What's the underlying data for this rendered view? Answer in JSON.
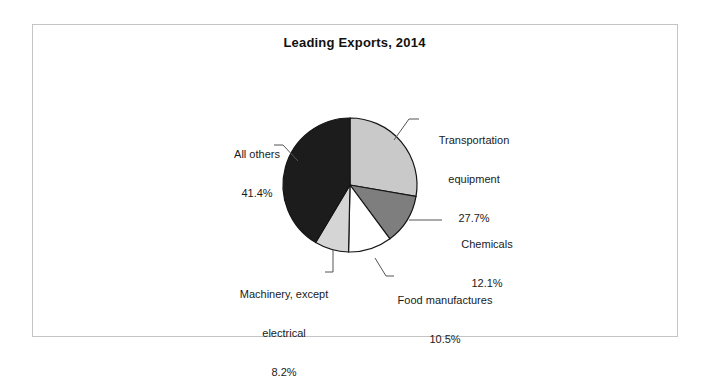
{
  "figure": {
    "title": "Leading Exports, 2014",
    "frame_color": "#c4c4c4",
    "background": "#ffffff"
  },
  "chart_data": {
    "type": "pie",
    "title": "Leading Exports, 2014",
    "xlabel": "",
    "ylabel": "",
    "legend": "none",
    "start_angle_deg": 0,
    "direction": "clockwise",
    "center": {
      "x": 350,
      "y": 185
    },
    "radius": 67,
    "categories": [
      "Transportation equipment",
      "Chemicals",
      "Food manufactures",
      "Machinery, except electrical",
      "All others"
    ],
    "values": [
      27.7,
      12.1,
      10.5,
      8.2,
      41.4
    ],
    "value_labels": [
      "27.7%",
      "12.1%",
      "10.5%",
      "8.2%",
      "41.4%"
    ],
    "colors": [
      "#c9c9c9",
      "#7e7e7e",
      "#ffffff",
      "#d5d5d5",
      "#1c1c1c"
    ],
    "slices": [
      {
        "name": "Transportation equipment",
        "label_line1": "Transportation",
        "label_line2": "equipment",
        "percent_text": "27.7%",
        "value": 27.7,
        "color": "#c9c9c9"
      },
      {
        "name": "Chemicals",
        "label_line1": "Chemicals",
        "label_line2": "",
        "percent_text": "12.1%",
        "value": 12.1,
        "color": "#7e7e7e"
      },
      {
        "name": "Food manufactures",
        "label_line1": "Food manufactures",
        "label_line2": "",
        "percent_text": "10.5%",
        "value": 10.5,
        "color": "#ffffff"
      },
      {
        "name": "Machinery, except electrical",
        "label_line1": "Machinery, except",
        "label_line2": "electrical",
        "percent_text": "8.2%",
        "value": 8.2,
        "color": "#d5d5d5"
      },
      {
        "name": "All others",
        "label_line1": "All others",
        "label_line2": "",
        "percent_text": "41.4%",
        "value": 41.4,
        "color": "#1c1c1c"
      }
    ]
  }
}
